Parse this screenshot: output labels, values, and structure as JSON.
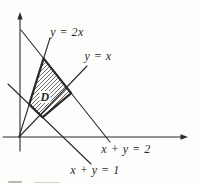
{
  "figure": {
    "background": "#fdfdfc",
    "ink_color": "#2a2a2a",
    "axes": {
      "x_axis": {
        "from": [
          3,
          137
        ],
        "to": [
          183,
          137
        ],
        "arrow": "right"
      },
      "y_axis": {
        "from": [
          20,
          151
        ],
        "to": [
          20,
          18
        ],
        "arrow": "up"
      }
    },
    "lines": [
      {
        "name": "line-y-equals-2x",
        "equation": "y = 2x",
        "from": [
          19,
          137
        ],
        "to": [
          50,
          38
        ]
      },
      {
        "name": "line-y-equals-x",
        "equation": "y = x",
        "from": [
          19,
          137
        ],
        "to": [
          87,
          66
        ]
      },
      {
        "name": "line-x-plus-y-equals-1",
        "equation": "x + y = 1",
        "from": [
          8,
          84
        ],
        "to": [
          91,
          164
        ]
      },
      {
        "name": "line-x-plus-y-equals-2",
        "equation": "x + y = 2",
        "from": [
          21,
          30
        ],
        "to": [
          110,
          142
        ]
      }
    ],
    "labels": {
      "y_2x": "y = 2x",
      "y_x": "y = x",
      "x_y_2": "x + y = 2",
      "x_y_1": "x + y = 1"
    },
    "region": {
      "label": "D",
      "description": "hatched quadrilateral bounded by y=2x, y=x, x+y=1, x+y=2",
      "vertices": [
        [
          29.2,
          104.4
        ],
        [
          43.6,
          58.4
        ],
        [
          71.2,
          93.2
        ],
        [
          42.5,
          117.3
        ]
      ],
      "hatch_direction": "bottom-left-to-top-right"
    }
  }
}
